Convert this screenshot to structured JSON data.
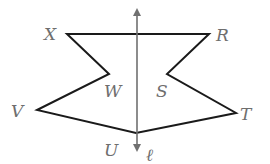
{
  "diagram": {
    "type": "reflection-figure",
    "colors": {
      "shape_stroke": "#1a1a1a",
      "axis": "#707070",
      "label": "#6e6e6e"
    },
    "axis": {
      "label": "ℓ",
      "x": 137,
      "y_top": 8,
      "y_bottom": 152
    },
    "polygon_points": "67,34 209,34 167,74 236,113 136,133 37,110 109,74",
    "labels": {
      "X": "X",
      "R": "R",
      "W": "W",
      "S": "S",
      "V": "V",
      "T": "T",
      "U": "U",
      "l": "ℓ"
    }
  }
}
